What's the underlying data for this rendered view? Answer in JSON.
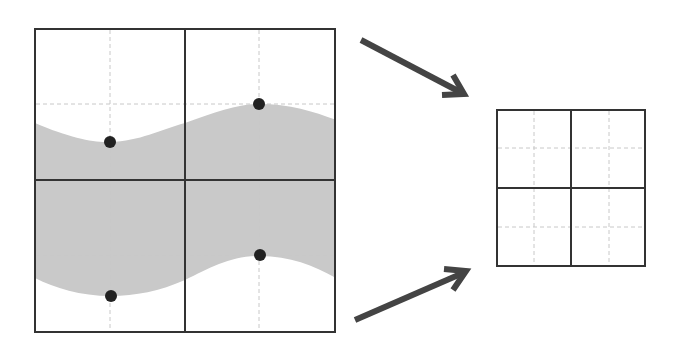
{
  "diagram": {
    "colors": {
      "background": "#ffffff",
      "grid_line": "#333333",
      "dashed_line": "#c8c8c8",
      "band_fill": "#c9c9c9",
      "point": "#222222",
      "arrow": "#444444"
    },
    "left_grid": {
      "x": 35,
      "y": 29,
      "width": 300,
      "height": 303,
      "mid_x": 185,
      "mid_y": 180,
      "dashed_x": [
        110,
        259
      ],
      "dashed_y": [
        104,
        255
      ],
      "points": [
        {
          "x": 110,
          "y": 142
        },
        {
          "x": 259,
          "y": 104
        },
        {
          "x": 111,
          "y": 296
        },
        {
          "x": 260,
          "y": 255
        }
      ]
    },
    "right_grid": {
      "x": 497,
      "y": 110,
      "width": 148,
      "height": 156,
      "mid_x": 571,
      "mid_y": 188,
      "dashed_x": [
        534,
        609
      ],
      "dashed_y": [
        148,
        227
      ]
    },
    "arrows": [
      {
        "name": "top-arrow",
        "from": [
          361,
          40
        ],
        "to": [
          463,
          93
        ]
      },
      {
        "name": "bottom-arrow",
        "from": [
          355,
          320
        ],
        "to": [
          465,
          272
        ]
      }
    ]
  }
}
